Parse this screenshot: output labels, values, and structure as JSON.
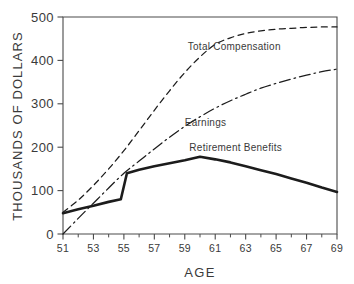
{
  "chart_data": {
    "type": "line",
    "title": "",
    "xlabel": "AGE",
    "ylabel": "THOUSANDS OF DOLLARS",
    "xlim": [
      51,
      69
    ],
    "ylim": [
      0,
      500
    ],
    "grid": false,
    "legend_position": "inline-annotations",
    "x_ticks": [
      "51",
      "53",
      "55",
      "57",
      "59",
      "61",
      "63",
      "65",
      "67",
      "69"
    ],
    "x_tick_values": [
      51,
      53,
      55,
      57,
      59,
      61,
      63,
      65,
      67,
      69
    ],
    "x_minor_tick_values": [
      52,
      54,
      56,
      58,
      60,
      62,
      64,
      66,
      68
    ],
    "y_ticks": [
      "0",
      "100",
      "200",
      "300",
      "400",
      "500"
    ],
    "y_tick_values": [
      0,
      100,
      200,
      300,
      400,
      500
    ],
    "series": [
      {
        "name": "Total Compensation",
        "style": "dashed",
        "color": "#1c1c1c",
        "label_x": 59.2,
        "label_y": 425,
        "x": [
          51,
          52,
          53,
          54,
          55,
          56,
          57,
          58,
          59,
          60,
          61,
          62,
          63,
          64,
          65,
          66,
          67,
          68,
          69
        ],
        "values": [
          50,
          78,
          112,
          150,
          192,
          238,
          285,
          330,
          372,
          408,
          437,
          452,
          462,
          468,
          472,
          474,
          476,
          477,
          477
        ]
      },
      {
        "name": "Earnings",
        "style": "dash-dot",
        "color": "#1c1c1c",
        "label_x": 59.0,
        "label_y": 250,
        "x": [
          51,
          52,
          53,
          54,
          55,
          56,
          57,
          58,
          59,
          60,
          61,
          62,
          63,
          64,
          65,
          66,
          67,
          68,
          69
        ],
        "values": [
          0,
          36,
          71,
          106,
          140,
          168,
          196,
          223,
          248,
          270,
          290,
          307,
          322,
          336,
          347,
          357,
          366,
          374,
          380
        ]
      },
      {
        "name": "Retirement Benefits",
        "style": "solid-bold",
        "color": "#1c1c1c",
        "label_x": 59.3,
        "label_y": 192,
        "x": [
          51,
          52,
          53,
          54,
          54.8,
          55.2,
          56,
          57,
          58,
          59,
          60,
          61,
          62,
          63,
          64,
          65,
          66,
          67,
          68,
          69
        ],
        "values": [
          48,
          57,
          65,
          74,
          80,
          140,
          148,
          156,
          163,
          170,
          178,
          172,
          165,
          156,
          147,
          138,
          128,
          118,
          107,
          97
        ]
      }
    ]
  }
}
